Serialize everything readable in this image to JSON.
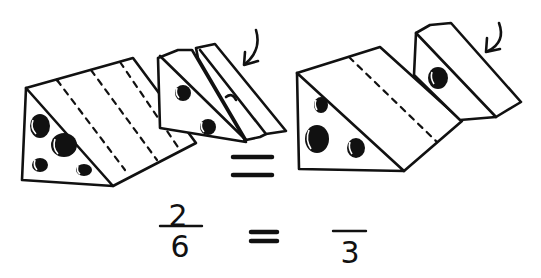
{
  "illustration": {
    "subject": "Cheese wedges showing equivalent fractions",
    "left_group": {
      "label": "six-sixths cheese wedge with two slices removed",
      "slices_shown": 4,
      "slices_removed": 2,
      "arrow": "curved-arrow pointing to removed slices"
    },
    "right_group": {
      "label": "three-thirds cheese wedge with one slice removed",
      "slices_shown": 2,
      "slices_removed": 1,
      "arrow": "curved-arrow pointing to removed slice"
    },
    "equals_between_pictures": "="
  },
  "equation": {
    "left_numerator": "2",
    "left_denominator": "6",
    "equals": "=",
    "right_numerator": "",
    "right_denominator": "3"
  },
  "colors": {
    "ink": "#111111",
    "background": "#ffffff"
  }
}
